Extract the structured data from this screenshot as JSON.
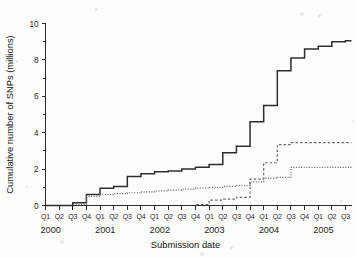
{
  "chart_data": {
    "type": "line",
    "title": "",
    "xlabel": "Submission date",
    "ylabel": "Cumulative number of SNPs (millions)",
    "ylim": [
      0,
      10
    ],
    "yticks": [
      0,
      2,
      4,
      6,
      8,
      10
    ],
    "ytick_labels": [
      "0",
      "2",
      "4",
      "6",
      "8",
      "10"
    ],
    "grid": false,
    "legend": "none",
    "x_quarter_labels": [
      "Q1",
      "Q2",
      "Q3",
      "Q4",
      "Q1",
      "Q2",
      "Q3",
      "Q4",
      "Q1",
      "Q2",
      "Q3",
      "Q4",
      "Q1",
      "Q2",
      "Q3",
      "Q4",
      "Q1",
      "Q2",
      "Q3",
      "Q4",
      "Q1",
      "Q2",
      "Q3"
    ],
    "x_year_labels": [
      "2000",
      "2001",
      "2002",
      "2003",
      "2004",
      "2005"
    ],
    "x": [
      "2000-Q1",
      "2000-Q2",
      "2000-Q3",
      "2000-Q4",
      "2001-Q1",
      "2001-Q2",
      "2001-Q3",
      "2001-Q4",
      "2002-Q1",
      "2002-Q2",
      "2002-Q3",
      "2002-Q4",
      "2003-Q1",
      "2003-Q2",
      "2003-Q3",
      "2003-Q4",
      "2004-Q1",
      "2004-Q2",
      "2004-Q3",
      "2004-Q4",
      "2005-Q1",
      "2005-Q2",
      "2005-Q3"
    ],
    "series": [
      {
        "name": "total SNPs",
        "style": "solid",
        "values": [
          0,
          0,
          0.15,
          0.6,
          0.95,
          1.05,
          1.6,
          1.75,
          1.85,
          1.9,
          2.0,
          2.1,
          2.25,
          2.9,
          3.25,
          4.6,
          5.5,
          7.4,
          8.1,
          8.6,
          8.75,
          9.0,
          9.05
        ]
      },
      {
        "name": "validated SNPs",
        "style": "dashed",
        "values": [
          0,
          0,
          0,
          0,
          0,
          0,
          0,
          0,
          0,
          0,
          0,
          0.05,
          0.3,
          0.35,
          0.45,
          1.45,
          2.35,
          3.35,
          3.45,
          3.45,
          3.45,
          3.45,
          3.45
        ]
      },
      {
        "name": "mapped SNPs",
        "style": "dotted",
        "values": [
          0,
          0,
          0.05,
          0.5,
          0.6,
          0.65,
          0.7,
          0.75,
          0.8,
          0.85,
          0.9,
          0.95,
          1.0,
          1.05,
          1.1,
          1.3,
          1.5,
          1.55,
          2.1,
          2.1,
          2.1,
          2.1,
          2.1
        ]
      }
    ]
  }
}
